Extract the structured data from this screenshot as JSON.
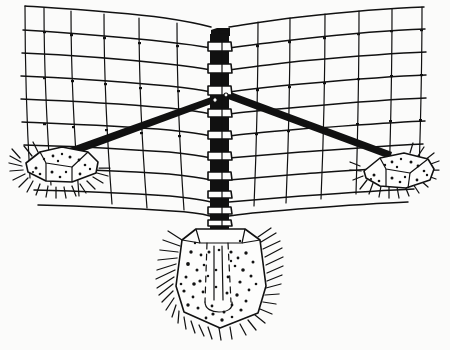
{
  "figure": {
    "title": "Braced fence corner post with concrete footing",
    "type": "line-art-illustration",
    "style": "black ink pen drawing on white background",
    "background_color": "#fbfbfa",
    "ink_color": "#111111",
    "width": 450,
    "height": 350
  },
  "components": {
    "post": {
      "name": "corner-post",
      "label": "Steel corner post",
      "description": "Vertical dark post with light wrap bands where fence wires pass",
      "x_left": 210,
      "x_right": 229,
      "y_top": 28,
      "y_bottom": 232,
      "cap_label": "post cap bracket",
      "band_count": 13
    },
    "footing": {
      "name": "concrete-footing",
      "label": "Concrete footing",
      "description": "Tapered stippled concrete block set in ground around post base",
      "top_y": 228,
      "bottom_y": 327,
      "left_x": 172,
      "right_x": 268,
      "fill_color": "#fdfdfc",
      "stipple_color": "#131313"
    },
    "braces": [
      {
        "name": "left-brace",
        "label": "Left diagonal brace",
        "from": [
          60,
          156
        ],
        "to": [
          214,
          98
        ],
        "color": "#111111"
      },
      {
        "name": "right-brace",
        "label": "Right diagonal brace",
        "from": [
          228,
          94
        ],
        "to": [
          392,
          157
        ],
        "color": "#111111"
      }
    ],
    "anchors": [
      {
        "name": "left-anchor-block",
        "label": "Left concrete anchor block",
        "center": [
          62,
          168
        ],
        "description": "Stippled concrete block resting on grass tuft"
      },
      {
        "name": "right-anchor-block",
        "label": "Right concrete anchor block",
        "center": [
          394,
          170
        ],
        "description": "Stippled concrete block resting on grass tuft"
      }
    ],
    "mesh": {
      "name": "woven-wire-fence-mesh",
      "label": "Woven wire fence mesh",
      "horizontal_wire_count": 9,
      "left_vertical_stay_count": 6,
      "right_vertical_stay_count": 6,
      "description": "Two perspective panels of horizontal line wires and vertical stay wires meeting at the corner post"
    },
    "ground": {
      "name": "grass-tufts",
      "label": "Grass tufts",
      "description": "Radiating spiky ink strokes around footing and anchor blocks"
    }
  },
  "annotations": {
    "visible_text": []
  }
}
